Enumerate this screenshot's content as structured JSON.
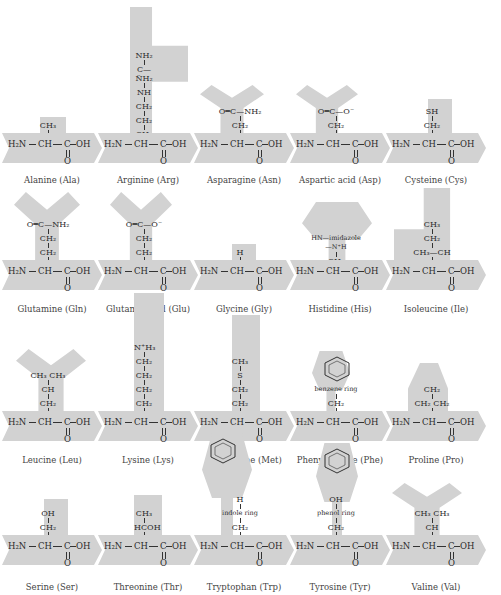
{
  "backbone": {
    "amine": "H₂N",
    "alpha": "CH",
    "carbon": "C",
    "hydroxyl": "OH",
    "oxygen": "O"
  },
  "amino_acids": [
    {
      "name": "Alanine (Ala)",
      "side_chain": [
        "CH₃"
      ]
    },
    {
      "name": "Arginine (Arg)",
      "side_chain": [
        "NH₂",
        "C—N̈H₂",
        "NH",
        "CH₂",
        "CH₂",
        "CH₂"
      ]
    },
    {
      "name": "Asparagine (Asn)",
      "side_chain": [
        "O═C—NH₂",
        "CH₂"
      ]
    },
    {
      "name": "Aspartic acid (Asp)",
      "side_chain": [
        "O═C—O⁻",
        "CH₂"
      ]
    },
    {
      "name": "Cysteine (Cys)",
      "side_chain": [
        "SH",
        "CH₂"
      ]
    },
    {
      "name": "Glutamine (Gln)",
      "side_chain": [
        "O═C—NH₂",
        "CH₂",
        "CH₂"
      ]
    },
    {
      "name": "Glutamic acid (Glu)",
      "side_chain": [
        "O═C—O⁻",
        "CH₂",
        "CH₂"
      ]
    },
    {
      "name": "Glycine (Gly)",
      "side_chain": [
        "H"
      ]
    },
    {
      "name": "Histidine (His)",
      "side_chain": [
        "HN—imidazole—N⁺H",
        "CH₂"
      ]
    },
    {
      "name": "Isoleucine (Ile)",
      "side_chain": [
        "CH₃",
        "CH₂",
        "CH₃—CH"
      ]
    },
    {
      "name": "Leucine (Leu)",
      "side_chain": [
        "CH₃  CH₃",
        "CH",
        "CH₂"
      ]
    },
    {
      "name": "Lysine (Lys)",
      "side_chain": [
        "N⁺H₃",
        "CH₂",
        "CH₂",
        "CH₂",
        "CH₂"
      ]
    },
    {
      "name": "Methionine (Met)",
      "side_chain": [
        "CH₃",
        "S",
        "CH₂",
        "CH₂"
      ]
    },
    {
      "name": "Phenylalanine (Phe)",
      "side_chain": [
        "benzene ring",
        "CH₂"
      ]
    },
    {
      "name": "Proline (Pro)",
      "side_chain": [
        "CH₂",
        "CH₂ CH₂"
      ]
    },
    {
      "name": "Serine (Ser)",
      "side_chain": [
        "OH",
        "CH₂"
      ]
    },
    {
      "name": "Threonine (Thr)",
      "side_chain": [
        "CH₃",
        "HCOH"
      ]
    },
    {
      "name": "Tryptophan (Trp)",
      "side_chain": [
        "H",
        "indole ring",
        "CH₂"
      ]
    },
    {
      "name": "Tyrosine (Tyr)",
      "side_chain": [
        "OH",
        "phenol ring",
        "CH₂"
      ]
    },
    {
      "name": "Valine (Val)",
      "side_chain": [
        "CH₃  CH₃",
        "CH"
      ]
    }
  ],
  "colors": {
    "shape_fill": "#d2d2d2",
    "text": "#2a2a2a"
  }
}
